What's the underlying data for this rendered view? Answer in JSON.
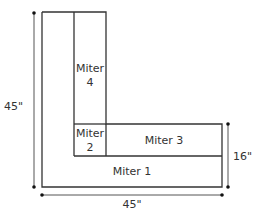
{
  "diagram": {
    "pieces": [
      {
        "name": "Miter 1",
        "line1": "Miter 1"
      },
      {
        "name": "Miter 2",
        "line1": "Miter",
        "line2": "2"
      },
      {
        "name": "Miter 3",
        "line1": "Miter 3"
      },
      {
        "name": "Miter 4",
        "line1": "Miter",
        "line2": "4"
      }
    ],
    "dimensions": {
      "height": "45\"",
      "width": "45\"",
      "depth": "16\""
    },
    "colors": {
      "line": "#333333",
      "dim": "#555555"
    }
  }
}
